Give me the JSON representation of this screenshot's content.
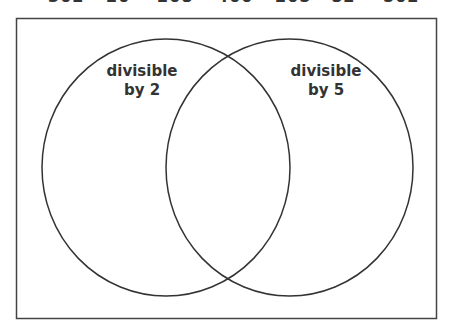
{
  "numbers": [
    {
      "value": "302",
      "x": 48
    },
    {
      "value": "20",
      "x": 106
    },
    {
      "value": "208",
      "x": 157
    },
    {
      "value": "400",
      "x": 217
    },
    {
      "value": "205",
      "x": 275
    },
    {
      "value": "82",
      "x": 331
    },
    {
      "value": "502",
      "x": 383
    }
  ],
  "diagram": {
    "type": "venn",
    "sets": [
      {
        "label_line1": "divisible",
        "label_line2": "by 2"
      },
      {
        "label_line1": "divisible",
        "label_line2": "by 5"
      }
    ],
    "stroke_color": "#333333",
    "background": "#ffffff"
  }
}
